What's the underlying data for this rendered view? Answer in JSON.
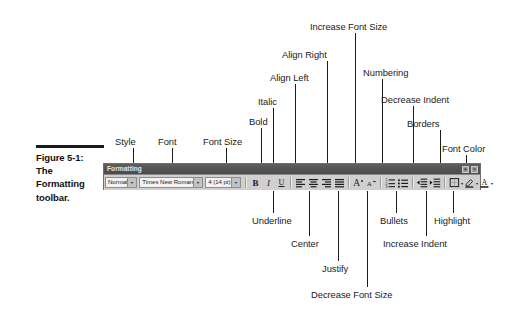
{
  "figure": {
    "caption_lines": [
      "Figure 5-1:",
      "The",
      "Formatting",
      "toolbar."
    ]
  },
  "toolbar": {
    "title": "Formatting",
    "titlebar_buttons": [
      {
        "name": "toolbar-options-button",
        "glyph": "▾"
      },
      {
        "name": "toolbar-close-button",
        "glyph": "×"
      }
    ],
    "style_combo": {
      "value": "Normal",
      "arrow": "▾"
    },
    "font_combo": {
      "value": "Times New Roman",
      "arrow": "▾"
    },
    "size_combo": {
      "value": "4  (14 pt)",
      "arrow": "▾"
    },
    "buttons": [
      {
        "name": "bold-icon",
        "label": "Bold"
      },
      {
        "name": "italic-icon",
        "label": "Italic"
      },
      {
        "name": "underline-icon",
        "label": "Underline"
      },
      {
        "name": "align-left-icon",
        "label": "Align Left"
      },
      {
        "name": "align-center-icon",
        "label": "Center"
      },
      {
        "name": "align-right-icon",
        "label": "Align Right"
      },
      {
        "name": "justify-icon",
        "label": "Justify"
      },
      {
        "name": "increase-font-size-icon",
        "label": "Increase Font Size"
      },
      {
        "name": "decrease-font-size-icon",
        "label": "Decrease Font Size"
      },
      {
        "name": "numbering-icon",
        "label": "Numbering"
      },
      {
        "name": "bullets-icon",
        "label": "Bullets"
      },
      {
        "name": "decrease-indent-icon",
        "label": "Decrease Indent"
      },
      {
        "name": "increase-indent-icon",
        "label": "Increase Indent"
      },
      {
        "name": "borders-icon",
        "label": "Borders"
      },
      {
        "name": "highlight-icon",
        "label": "Highlight"
      },
      {
        "name": "font-color-icon",
        "label": "Font Color"
      }
    ]
  },
  "callouts": {
    "above": [
      {
        "key": "style",
        "label": "Style"
      },
      {
        "key": "font",
        "label": "Font"
      },
      {
        "key": "font_size",
        "label": "Font Size"
      },
      {
        "key": "bold",
        "label": "Bold"
      },
      {
        "key": "italic",
        "label": "Italic"
      },
      {
        "key": "align_left",
        "label": "Align Left"
      },
      {
        "key": "align_right",
        "label": "Align Right"
      },
      {
        "key": "increase_font_size",
        "label": "Increase Font Size"
      },
      {
        "key": "numbering",
        "label": "Numbering"
      },
      {
        "key": "decrease_indent",
        "label": "Decrease Indent"
      },
      {
        "key": "borders",
        "label": "Borders"
      },
      {
        "key": "font_color",
        "label": "Font Color"
      }
    ],
    "below": [
      {
        "key": "underline",
        "label": "Underline"
      },
      {
        "key": "center",
        "label": "Center"
      },
      {
        "key": "justify",
        "label": "Justify"
      },
      {
        "key": "decrease_font_size",
        "label": "Decrease Font Size"
      },
      {
        "key": "bullets",
        "label": "Bullets"
      },
      {
        "key": "increase_indent",
        "label": "Increase Indent"
      },
      {
        "key": "highlight",
        "label": "Highlight"
      }
    ]
  }
}
